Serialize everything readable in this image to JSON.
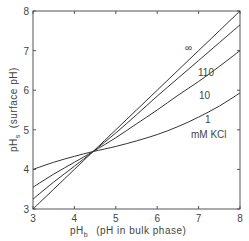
{
  "chart_data": {
    "type": "line",
    "title": "",
    "xlabel": "pHb (pH in bulk phase)",
    "ylabel": "pHs (surface pH)",
    "xlabel_parts": {
      "main": "pH",
      "sub": "b",
      "rest": "(pH  in bulk phase)"
    },
    "ylabel_parts": {
      "main": "pH",
      "sub": "s",
      "rest": "(surface  pH)"
    },
    "xlim": [
      3,
      8
    ],
    "ylim": [
      3,
      8
    ],
    "xticks": [
      3,
      4,
      5,
      6,
      7,
      8
    ],
    "yticks": [
      3,
      4,
      5,
      6,
      7,
      8
    ],
    "grid": false,
    "legend": "inline labels",
    "unit_annotation": "mM  KCl",
    "x": [
      3.0,
      3.5,
      4.0,
      4.45,
      5.0,
      5.5,
      6.0,
      6.5,
      7.0,
      7.5,
      8.0
    ],
    "series": [
      {
        "name": "∞",
        "label": "∞",
        "values": [
          3.0,
          3.5,
          4.0,
          4.45,
          5.0,
          5.5,
          6.0,
          6.5,
          7.0,
          7.5,
          8.0
        ]
      },
      {
        "name": "110",
        "label": "110",
        "values": [
          3.25,
          3.68,
          4.08,
          4.45,
          4.92,
          5.38,
          5.85,
          6.3,
          6.75,
          7.2,
          7.65
        ]
      },
      {
        "name": "10",
        "label": "10",
        "values": [
          3.55,
          3.88,
          4.18,
          4.45,
          4.8,
          5.15,
          5.5,
          5.87,
          6.22,
          6.6,
          7.0
        ]
      },
      {
        "name": "1",
        "label": "1",
        "values": [
          4.0,
          4.18,
          4.33,
          4.45,
          4.58,
          4.72,
          4.88,
          5.08,
          5.32,
          5.6,
          5.93
        ]
      }
    ],
    "crossing_point": {
      "x": 4.45,
      "y": 4.45
    }
  }
}
